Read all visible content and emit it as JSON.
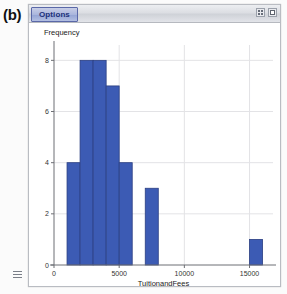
{
  "figure": {
    "label": "(b)"
  },
  "window": {
    "options_button_label": "Options",
    "controls": [
      {
        "name": "restore-button",
        "icon": "restore-icon"
      },
      {
        "name": "close-button",
        "icon": "close-icon"
      }
    ]
  },
  "statusbar": {
    "grip_icon": "grip-icon"
  },
  "colors": {
    "bar_fill": "#3c5bb4",
    "bar_stroke": "#2b3f82",
    "axis": "#6d6f74",
    "grid": "#e3e3e6",
    "title_bar": "#dcdee3",
    "options_text": "#20307a"
  },
  "chart_data": {
    "type": "bar",
    "title": "",
    "xlabel": "TuitionandFees",
    "ylabel": "Frequency",
    "grid": true,
    "legend": "none",
    "xlim": [
      0,
      16800
    ],
    "ylim": [
      0,
      8.6
    ],
    "xticks": [
      0,
      5000,
      10000,
      15000
    ],
    "xtick_labels": [
      "0",
      "5000",
      "10000",
      "15000"
    ],
    "yticks": [
      0,
      2,
      4,
      6,
      8
    ],
    "ytick_labels": [
      "0",
      "2",
      "4",
      "6",
      "8"
    ],
    "bin_width": 1000,
    "bins": [
      {
        "x0": 1000,
        "x1": 2000,
        "value": 4
      },
      {
        "x0": 2000,
        "x1": 3000,
        "value": 8
      },
      {
        "x0": 3000,
        "x1": 4000,
        "value": 8
      },
      {
        "x0": 4000,
        "x1": 5000,
        "value": 7
      },
      {
        "x0": 5000,
        "x1": 6000,
        "value": 4
      },
      {
        "x0": 7000,
        "x1": 8000,
        "value": 3
      },
      {
        "x0": 15000,
        "x1": 16000,
        "value": 1
      }
    ],
    "categories": [
      "1000-2000",
      "2000-3000",
      "3000-4000",
      "4000-5000",
      "5000-6000",
      "7000-8000",
      "15000-16000"
    ],
    "values": [
      4,
      8,
      8,
      7,
      4,
      3,
      1
    ]
  }
}
